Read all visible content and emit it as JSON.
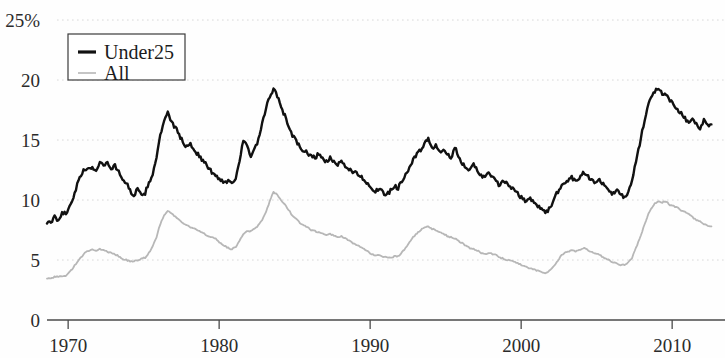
{
  "chart_data": {
    "type": "line",
    "title": "",
    "subtitle": "",
    "xlabel": "",
    "ylabel": "",
    "ylim": [
      0,
      25
    ],
    "xlim": [
      1968.6,
      2013.5
    ],
    "grid": true,
    "y_unit_suffix": "%",
    "legend_position": "top-left",
    "yticks": [
      {
        "value": 25,
        "label": "25%"
      },
      {
        "value": 20,
        "label": "20"
      },
      {
        "value": 15,
        "label": "15"
      },
      {
        "value": 10,
        "label": "10"
      },
      {
        "value": 5,
        "label": "5"
      },
      {
        "value": 0,
        "label": "0"
      }
    ],
    "xticks": [
      {
        "value": 1970,
        "label": "1970"
      },
      {
        "value": 1980,
        "label": "1980"
      },
      {
        "value": 1990,
        "label": "1990"
      },
      {
        "value": 2000,
        "label": "2000"
      },
      {
        "value": 2010,
        "label": "2010"
      }
    ],
    "x_start": 1968.6,
    "x_step": 0.25,
    "series": [
      {
        "name": "Under25",
        "color": "#111111",
        "width": 2.4,
        "values": [
          8.2,
          8.0,
          8.6,
          8.3,
          9.0,
          8.8,
          9.6,
          10.2,
          11.3,
          12.0,
          12.6,
          12.5,
          12.8,
          12.4,
          13.2,
          12.9,
          13.1,
          12.6,
          12.9,
          12.3,
          11.8,
          11.4,
          10.8,
          10.4,
          10.9,
          10.3,
          10.6,
          11.4,
          12.2,
          13.6,
          15.3,
          16.6,
          17.2,
          16.5,
          16.0,
          15.5,
          14.8,
          14.4,
          14.7,
          14.2,
          13.8,
          13.4,
          13.0,
          12.6,
          12.2,
          11.9,
          11.7,
          11.5,
          11.6,
          11.4,
          11.9,
          13.3,
          14.9,
          14.5,
          13.6,
          14.2,
          15.0,
          16.3,
          17.6,
          18.6,
          19.3,
          18.6,
          17.8,
          17.0,
          16.2,
          15.4,
          14.9,
          14.4,
          14.1,
          13.9,
          13.7,
          13.5,
          13.9,
          13.4,
          13.2,
          13.5,
          13.1,
          12.9,
          13.2,
          12.8,
          12.6,
          12.4,
          12.2,
          12.0,
          11.7,
          11.4,
          11.0,
          10.7,
          10.9,
          10.6,
          10.4,
          10.8,
          11.2,
          11.0,
          11.6,
          12.2,
          12.7,
          13.3,
          13.8,
          14.2,
          14.6,
          15.2,
          14.3,
          14.6,
          13.9,
          14.2,
          13.8,
          13.4,
          14.4,
          13.7,
          13.1,
          12.8,
          12.4,
          12.9,
          12.5,
          12.1,
          11.8,
          12.3,
          11.9,
          11.5,
          11.2,
          11.6,
          11.3,
          11.0,
          10.7,
          10.4,
          10.1,
          9.9,
          10.2,
          9.8,
          9.5,
          9.2,
          8.9,
          9.3,
          9.8,
          10.5,
          11.1,
          11.4,
          11.6,
          11.9,
          11.6,
          11.9,
          12.3,
          12.0,
          11.8,
          11.5,
          11.7,
          11.4,
          11.1,
          10.8,
          10.5,
          10.8,
          10.4,
          10.2,
          10.7,
          11.6,
          13.2,
          14.6,
          16.2,
          17.6,
          18.5,
          19.1,
          19.3,
          18.8,
          18.9,
          18.3,
          18.0,
          17.6,
          17.2,
          16.8,
          16.5,
          16.9,
          16.3,
          16.0,
          16.6,
          16.2,
          16.3
        ]
      },
      {
        "name": "All",
        "color": "#b7b7b7",
        "width": 1.8,
        "values": [
          3.5,
          3.5,
          3.6,
          3.6,
          3.6,
          3.7,
          4.0,
          4.4,
          4.8,
          5.2,
          5.6,
          5.8,
          5.9,
          5.8,
          5.9,
          5.8,
          5.7,
          5.6,
          5.5,
          5.3,
          5.1,
          5.0,
          4.9,
          4.9,
          5.0,
          5.1,
          5.2,
          5.6,
          6.1,
          6.9,
          8.0,
          8.7,
          9.1,
          8.9,
          8.6,
          8.4,
          8.1,
          7.9,
          7.7,
          7.6,
          7.5,
          7.3,
          7.1,
          7.0,
          6.9,
          6.7,
          6.4,
          6.2,
          6.0,
          5.9,
          6.1,
          6.6,
          7.2,
          7.4,
          7.4,
          7.6,
          7.9,
          8.3,
          9.0,
          9.9,
          10.7,
          10.4,
          10.0,
          9.6,
          9.2,
          8.7,
          8.4,
          8.1,
          7.9,
          7.7,
          7.5,
          7.4,
          7.3,
          7.2,
          7.1,
          7.2,
          7.0,
          6.9,
          7.0,
          6.8,
          6.6,
          6.4,
          6.2,
          6.1,
          5.9,
          5.7,
          5.5,
          5.4,
          5.4,
          5.3,
          5.2,
          5.2,
          5.3,
          5.3,
          5.6,
          6.0,
          6.5,
          6.9,
          7.2,
          7.5,
          7.7,
          7.8,
          7.6,
          7.5,
          7.3,
          7.2,
          7.0,
          6.9,
          6.8,
          6.6,
          6.4,
          6.2,
          6.0,
          5.9,
          5.8,
          5.6,
          5.5,
          5.6,
          5.5,
          5.4,
          5.2,
          5.1,
          5.0,
          4.9,
          4.8,
          4.7,
          4.5,
          4.4,
          4.3,
          4.2,
          4.1,
          4.0,
          3.9,
          4.1,
          4.4,
          4.8,
          5.3,
          5.6,
          5.7,
          5.8,
          5.7,
          5.8,
          6.0,
          5.9,
          5.7,
          5.6,
          5.5,
          5.3,
          5.1,
          5.0,
          4.8,
          4.7,
          4.6,
          4.6,
          4.8,
          5.2,
          6.0,
          6.8,
          7.7,
          8.6,
          9.3,
          9.7,
          9.9,
          9.8,
          9.9,
          9.6,
          9.5,
          9.4,
          9.1,
          9.0,
          8.8,
          8.6,
          8.3,
          8.2,
          8.0,
          7.9,
          7.8
        ]
      }
    ],
    "legend": [
      {
        "label": "Under25",
        "color": "#111111",
        "width": 3.2
      },
      {
        "label": "All",
        "color": "#b7b7b7",
        "width": 1.6
      }
    ]
  }
}
